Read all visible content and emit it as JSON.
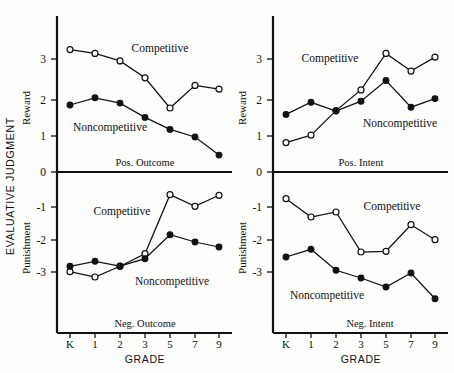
{
  "figure": {
    "y_axis_title": "EVALUATIVE JUDGMENT",
    "x_axis_title_left": "GRADE",
    "x_axis_title_right": "GRADE"
  },
  "labels": {
    "reward": "Reward",
    "punishment": "Punishment",
    "competitive": "Competitive",
    "noncompetitive": "Noncompetitive"
  },
  "chart_data": [
    {
      "type": "line",
      "panel": "top-left",
      "title": "Pos. Outcome",
      "xlabel": "GRADE",
      "ylabel": "Reward",
      "categories": [
        "K",
        "1",
        "2",
        "3",
        "5",
        "7",
        "9"
      ],
      "ylim": [
        0,
        3.6
      ],
      "yticks": [
        0,
        1,
        2,
        3
      ],
      "grid": false,
      "series": [
        {
          "name": "Competitive",
          "marker": "open-circle",
          "values": [
            3.25,
            3.15,
            2.95,
            2.5,
            1.7,
            2.3,
            2.2
          ]
        },
        {
          "name": "Noncompetitive",
          "marker": "filled-circle",
          "values": [
            1.78,
            1.97,
            1.83,
            1.45,
            1.13,
            0.93,
            0.45
          ]
        }
      ]
    },
    {
      "type": "line",
      "panel": "bottom-left",
      "title": "Neg. Outcome",
      "xlabel": "GRADE",
      "ylabel": "Punishment",
      "categories": [
        "K",
        "1",
        "2",
        "3",
        "5",
        "7",
        "9"
      ],
      "ylim": [
        -3.6,
        0
      ],
      "yticks": [
        0,
        -1,
        -2,
        -3
      ],
      "grid": false,
      "series": [
        {
          "name": "Competitive",
          "marker": "open-circle",
          "values": [
            -2.99,
            -3.15,
            -2.83,
            -2.45,
            -0.68,
            -1.03,
            -0.7
          ]
        },
        {
          "name": "Noncompetitive",
          "marker": "filled-circle",
          "values": [
            -2.83,
            -2.68,
            -2.82,
            -2.6,
            -1.88,
            -2.1,
            -2.25
          ]
        }
      ]
    },
    {
      "type": "line",
      "panel": "top-right",
      "title": "Pos. Intent",
      "xlabel": "GRADE",
      "ylabel": "Reward",
      "categories": [
        "K",
        "1",
        "2",
        "3",
        "5",
        "7",
        "9"
      ],
      "ylim": [
        0,
        3.6
      ],
      "yticks": [
        0,
        1,
        2,
        3
      ],
      "grid": false,
      "series": [
        {
          "name": "Competitive",
          "marker": "open-circle",
          "values": [
            0.78,
            0.98,
            1.63,
            2.18,
            3.15,
            2.68,
            3.05
          ]
        },
        {
          "name": "Noncompetitive",
          "marker": "filled-circle",
          "values": [
            1.53,
            1.85,
            1.62,
            1.88,
            2.43,
            1.72,
            1.95
          ]
        }
      ]
    },
    {
      "type": "line",
      "panel": "bottom-right",
      "title": "Neg. Intent",
      "xlabel": "GRADE",
      "ylabel": "Punishment",
      "categories": [
        "K",
        "1",
        "2",
        "3",
        "5",
        "7",
        "9"
      ],
      "ylim": [
        -4.0,
        0
      ],
      "yticks": [
        0,
        -1,
        -2,
        -3
      ],
      "grid": false,
      "series": [
        {
          "name": "Competitive",
          "marker": "open-circle",
          "values": [
            -0.8,
            -1.35,
            -1.2,
            -2.4,
            -2.38,
            -1.58,
            -2.03
          ]
        },
        {
          "name": "Noncompetitive",
          "marker": "filled-circle",
          "values": [
            -2.55,
            -2.32,
            -2.95,
            -3.18,
            -3.45,
            -3.03,
            -3.8
          ]
        }
      ]
    }
  ]
}
